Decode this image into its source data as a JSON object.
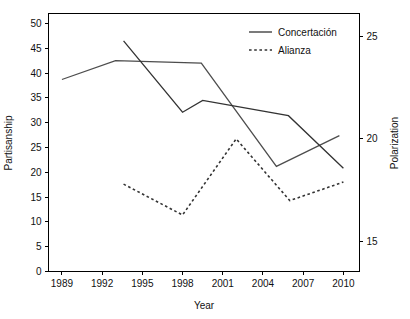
{
  "chart_data": {
    "type": "line",
    "title": "",
    "xlabel": "Year",
    "ylabel": "Partisanship",
    "y2label": "Polarization",
    "xlim": [
      1988.0,
      2011.2
    ],
    "ylim": [
      0,
      52
    ],
    "y2lim": [
      13.55,
      26.1
    ],
    "grid": false,
    "legend_position": "top-right",
    "x_ticks": [
      1989,
      1992,
      1995,
      1998,
      2001,
      2004,
      2007,
      2010
    ],
    "x_tick_labels": [
      "1989",
      "1992",
      "1995",
      "1998",
      "2001",
      "2004",
      "2007",
      "2010"
    ],
    "y_ticks": [
      0,
      5,
      10,
      15,
      20,
      25,
      30,
      35,
      40,
      45,
      50
    ],
    "y_tick_labels": [
      "0",
      "5",
      "10",
      "15",
      "20",
      "25",
      "30",
      "35",
      "40",
      "45",
      "50"
    ],
    "y2_ticks": [
      15,
      20,
      25
    ],
    "y2_tick_labels": [
      "15",
      "20",
      "25"
    ],
    "series": [
      {
        "name": "Concertación",
        "axis": "left",
        "style": "solid",
        "color": "#4d4d4d",
        "x": [
          1989,
          1993,
          1999.4,
          2005,
          2009.7
        ],
        "values": [
          38.7,
          42.5,
          42.0,
          21.2,
          27.4
        ]
      },
      {
        "name": "Alianza",
        "axis": "left",
        "style": "solid",
        "color": "#333333",
        "x": [
          1993.6,
          1998,
          1999.5,
          2005.9,
          2010
        ],
        "values": [
          46.5,
          32.1,
          34.5,
          31.4,
          20.8
        ]
      },
      {
        "name": "Alianza",
        "axis": "right",
        "style": "dashed",
        "color": "#333333",
        "x": [
          1993.6,
          1998,
          2002,
          2006,
          2010
        ],
        "values": [
          17.8,
          16.3,
          20.0,
          17.0,
          17.9
        ]
      }
    ],
    "legend": [
      {
        "label": "Concertación",
        "style": "solid"
      },
      {
        "label": "Alianza",
        "style": "dashed"
      }
    ]
  }
}
